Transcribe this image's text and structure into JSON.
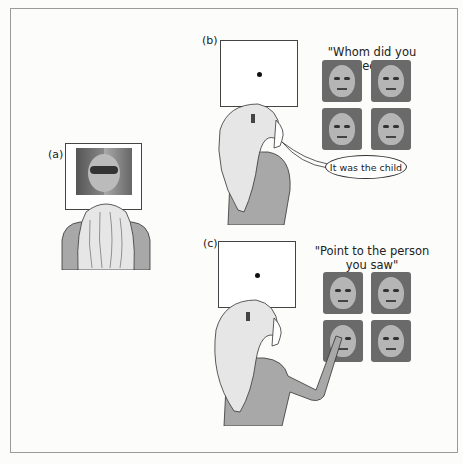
{
  "panels": {
    "a": {
      "label": "(a)",
      "stimulus": "chimeric-face"
    },
    "b": {
      "label": "(b)",
      "question": "\"Whom did you see?\"",
      "response": "It was the child",
      "faces": [
        "woman",
        "child",
        "woman-child-chimera",
        "old-man"
      ]
    },
    "c": {
      "label": "(c)",
      "question_line1": "\"Point to the person",
      "question_line2": "you saw\"",
      "faces": [
        "woman",
        "child",
        "woman-child-chimera",
        "old-man"
      ]
    }
  },
  "colors": {
    "shirt": "#a8a8a8",
    "hair": "#e6e6e6",
    "outline": "#333333",
    "frame": "#9a9a9a"
  }
}
